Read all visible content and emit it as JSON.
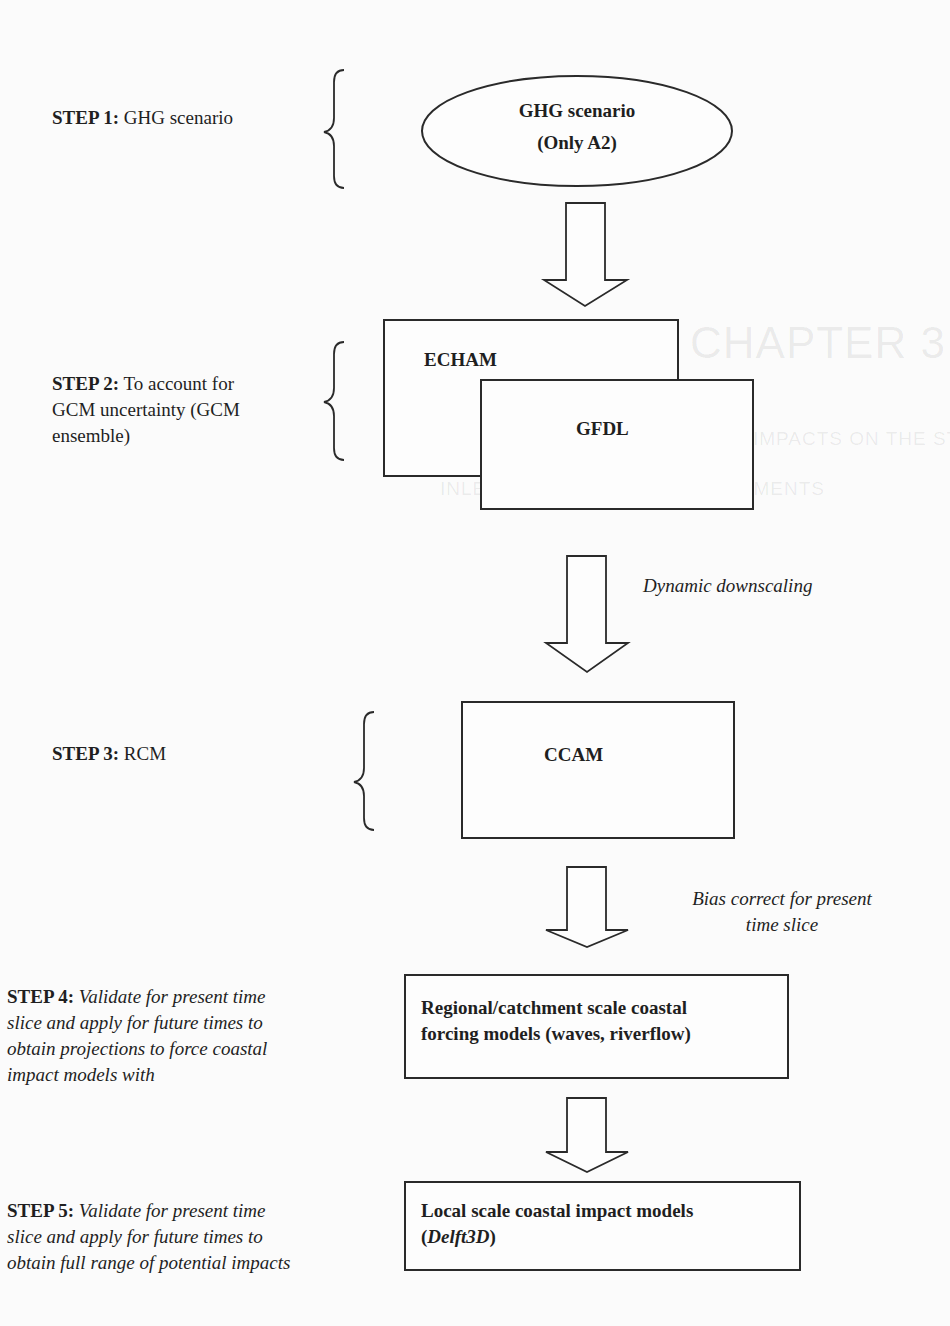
{
  "diagram": {
    "type": "flowchart",
    "steps": [
      {
        "label": "STEP 1:",
        "text": "GHG scenario",
        "text_style": "normal"
      },
      {
        "label": "STEP 2:",
        "text": "To account for GCM uncertainty (GCM ensemble)",
        "lines": [
          "To account for",
          "GCM uncertainty (GCM",
          "ensemble)"
        ],
        "text_style": "normal"
      },
      {
        "label": "STEP 3:",
        "text": "RCM",
        "text_style": "normal"
      },
      {
        "label": "STEP 4:",
        "text": "Validate for present time slice and apply for future times to obtain projections to force coastal impact models with",
        "lines": [
          "Validate for present time",
          "slice and apply for future times to",
          "obtain projections to force coastal",
          "impact models with"
        ],
        "text_style": "italic"
      },
      {
        "label": "STEP 5:",
        "text": "Validate for present time slice and apply for future times to obtain full range of potential impacts",
        "lines": [
          "Validate for present time",
          "slice and apply for future times to",
          "obtain full range of potential impacts"
        ],
        "text_style": "italic"
      }
    ],
    "nodes": {
      "ghg": {
        "shape": "ellipse",
        "lines": [
          "GHG scenario",
          "(Only A2)"
        ]
      },
      "echam": {
        "shape": "rect",
        "label": "ECHAM"
      },
      "gfdl": {
        "shape": "rect",
        "label": "GFDL"
      },
      "ccam": {
        "shape": "rect",
        "label": "CCAM"
      },
      "regional": {
        "shape": "rect",
        "lines": [
          "Regional/catchment scale coastal",
          "forcing models (waves, riverflow)"
        ]
      },
      "local": {
        "shape": "rect",
        "line1": "Local scale coastal impact models",
        "line2_open": "(",
        "line2_italic": "Delft3D",
        "line2_close": ")"
      }
    },
    "edges": [
      {
        "from": "ghg",
        "to": "echam",
        "label": ""
      },
      {
        "from": "gfdl",
        "to": "ccam",
        "label": "Dynamic downscaling"
      },
      {
        "from": "ccam",
        "to": "regional",
        "label_lines": [
          "Bias correct for present",
          "time slice"
        ]
      },
      {
        "from": "regional",
        "to": "local",
        "label": ""
      }
    ]
  },
  "bleed_through": {
    "heading": "CHAPTER 3",
    "line1": "ASSESSING CLIMATE CHANGE IMPACTS ON THE STABILITY OF SMALL TIDAL",
    "line2": "INLETS IN DATA RICH ENVIRONMENTS"
  },
  "colors": {
    "background": "#fbfbfb",
    "stroke": "#2a2a2a",
    "text": "#1f1f1f"
  }
}
